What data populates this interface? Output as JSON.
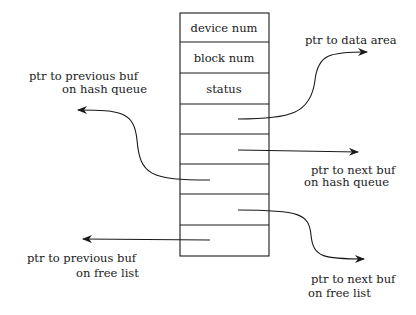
{
  "diagram": {
    "colors": {
      "ink": "#1a1a1a",
      "background": "#ffffff"
    },
    "fields": [
      {
        "label": "device num"
      },
      {
        "label": "block num"
      },
      {
        "label": "status"
      },
      {
        "label": ""
      },
      {
        "label": ""
      },
      {
        "label": ""
      },
      {
        "label": ""
      },
      {
        "label": ""
      }
    ],
    "pointers": {
      "data_area": {
        "line1": "ptr to data area"
      },
      "next_hash": {
        "line1": "ptr to next buf",
        "line2": "on hash queue"
      },
      "prev_hash": {
        "line1": "ptr to previous buf",
        "line2": "on hash queue"
      },
      "next_free": {
        "line1": "ptr to next buf",
        "line2": "on free list"
      },
      "prev_free": {
        "line1": "ptr to previous buf",
        "line2": "on free list"
      }
    }
  }
}
